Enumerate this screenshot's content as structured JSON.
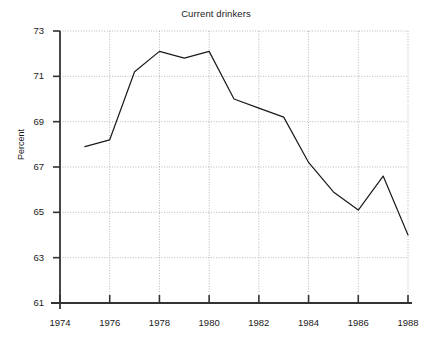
{
  "chart_data": {
    "type": "line",
    "title": "Current drinkers",
    "xlabel": "",
    "ylabel": "Percent",
    "x": [
      1975,
      1976,
      1977,
      1978,
      1979,
      1980,
      1981,
      1982,
      1983,
      1984,
      1985,
      1986,
      1987,
      1988
    ],
    "values": [
      67.9,
      68.2,
      71.2,
      72.1,
      71.8,
      72.1,
      70.0,
      69.6,
      69.2,
      67.2,
      65.9,
      65.1,
      66.6,
      64.0
    ],
    "series": [
      {
        "name": "Current drinkers",
        "values": [
          67.9,
          68.2,
          71.2,
          72.1,
          71.8,
          72.1,
          70.0,
          69.6,
          69.2,
          67.2,
          65.9,
          65.1,
          66.6,
          64.0
        ]
      }
    ],
    "xlim": [
      1974,
      1988
    ],
    "ylim": [
      61,
      73
    ],
    "xticks": [
      1974,
      1976,
      1978,
      1980,
      1982,
      1984,
      1986,
      1988
    ],
    "yticks": [
      61,
      63,
      65,
      67,
      69,
      71,
      73
    ],
    "xtick_labels": [
      "1974",
      "1976",
      "1978",
      "1980",
      "1982",
      "1984",
      "1986",
      "1988"
    ],
    "ytick_labels": [
      "61",
      "63",
      "65",
      "67",
      "69",
      "71",
      "73"
    ],
    "grid": true,
    "grid_style": "dotted",
    "legend": false,
    "line_color": "#1a1a1a",
    "grid_color": "#999999",
    "axis_color": "#333333",
    "background": "#ffffff"
  }
}
